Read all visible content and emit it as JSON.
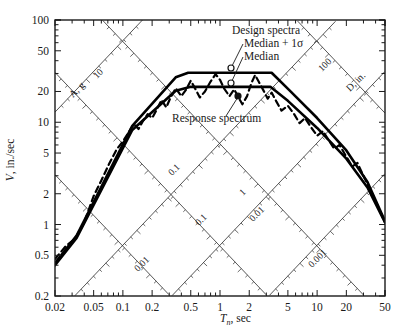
{
  "chart_data": {
    "type": "line",
    "title": "",
    "xlabel": "Tn, sec",
    "ylabel": "V, in./sec",
    "diag_up_label": "D, in.",
    "diag_down_label": "A, g",
    "xlim": [
      0.02,
      50
    ],
    "ylim": [
      0.2,
      100
    ],
    "xscale": "log",
    "yscale": "log",
    "grid": false,
    "xticks": [
      "0.02",
      "0.05",
      "0.1",
      "0.2",
      "0.5",
      "1",
      "2",
      "5",
      "10",
      "20",
      "50"
    ],
    "xtickvals": [
      0.02,
      0.05,
      0.1,
      0.2,
      0.5,
      1,
      2,
      5,
      10,
      20,
      50
    ],
    "yticks": [
      "0.2",
      "0.5",
      "1",
      "2",
      "5",
      "10",
      "20",
      "50",
      "100"
    ],
    "ytickvals": [
      0.2,
      0.5,
      1,
      2,
      5,
      10,
      20,
      50,
      100
    ],
    "diag_accel_labels": [
      "10",
      "0.1",
      "0.01",
      "0.001"
    ],
    "diag_accel_values": [
      10,
      0.1,
      0.01,
      0.001
    ],
    "diag_disp_labels": [
      "0.01",
      "0.1",
      "1",
      "100"
    ],
    "diag_disp_values": [
      0.01,
      0.1,
      1,
      100
    ],
    "series": [
      {
        "name": "Median + 1σ",
        "style": "solid",
        "color": "#000000",
        "width": 2.6,
        "points": [
          [
            0.02,
            0.42
          ],
          [
            0.0334,
            0.78
          ],
          [
            0.125,
            9.2
          ],
          [
            0.35,
            27.5
          ],
          [
            0.47,
            30.5
          ],
          [
            3.4,
            30.5
          ],
          [
            5.2,
            20.5
          ],
          [
            10,
            11.0
          ],
          [
            20,
            5.3
          ],
          [
            33,
            2.6
          ],
          [
            50,
            1.08
          ]
        ]
      },
      {
        "name": "Median",
        "style": "solid",
        "color": "#000000",
        "width": 2.6,
        "points": [
          [
            0.02,
            0.4
          ],
          [
            0.0334,
            0.74
          ],
          [
            0.125,
            8.4
          ],
          [
            0.35,
            20.3
          ],
          [
            0.5,
            22.2
          ],
          [
            3.3,
            22.2
          ],
          [
            5.0,
            16.2
          ],
          [
            10,
            8.8
          ],
          [
            20,
            4.4
          ],
          [
            33,
            2.3
          ],
          [
            50,
            1.05
          ]
        ]
      },
      {
        "name": "Response spectrum",
        "style": "dashed",
        "color": "#000000",
        "width": 2.2,
        "points": [
          [
            0.02,
            0.46
          ],
          [
            0.026,
            0.62
          ],
          [
            0.032,
            0.72
          ],
          [
            0.04,
            1.05
          ],
          [
            0.05,
            1.9
          ],
          [
            0.06,
            2.7
          ],
          [
            0.072,
            3.9
          ],
          [
            0.086,
            5.4
          ],
          [
            0.1,
            6.5
          ],
          [
            0.115,
            8.0
          ],
          [
            0.13,
            9.6
          ],
          [
            0.145,
            8.6
          ],
          [
            0.16,
            10.2
          ],
          [
            0.18,
            12.0
          ],
          [
            0.2,
            11.0
          ],
          [
            0.225,
            13.5
          ],
          [
            0.25,
            16.5
          ],
          [
            0.28,
            14.0
          ],
          [
            0.31,
            17.5
          ],
          [
            0.35,
            21.5
          ],
          [
            0.4,
            18.0
          ],
          [
            0.45,
            21.0
          ],
          [
            0.5,
            25.5
          ],
          [
            0.56,
            21.0
          ],
          [
            0.62,
            17.5
          ],
          [
            0.7,
            20.0
          ],
          [
            0.8,
            25.0
          ],
          [
            0.9,
            29.5
          ],
          [
            1.0,
            26.0
          ],
          [
            1.1,
            21.5
          ],
          [
            1.25,
            18.0
          ],
          [
            1.4,
            21.0
          ],
          [
            1.55,
            17.5
          ],
          [
            1.7,
            15.0
          ],
          [
            1.9,
            18.0
          ],
          [
            2.1,
            24.0
          ],
          [
            2.3,
            29.0
          ],
          [
            2.5,
            25.0
          ],
          [
            2.8,
            20.5
          ],
          [
            3.1,
            17.0
          ],
          [
            3.4,
            19.5
          ],
          [
            3.8,
            16.0
          ],
          [
            4.3,
            13.0
          ],
          [
            5.0,
            14.5
          ],
          [
            5.8,
            12.0
          ],
          [
            6.6,
            9.8
          ],
          [
            7.5,
            11.0
          ],
          [
            8.6,
            9.0
          ],
          [
            10,
            7.4
          ],
          [
            11.5,
            8.2
          ],
          [
            13,
            6.8
          ],
          [
            15,
            5.5
          ],
          [
            17,
            6.0
          ],
          [
            20,
            4.6
          ],
          [
            23,
            3.7
          ],
          [
            26,
            4.0
          ],
          [
            30,
            3.0
          ],
          [
            35,
            2.2
          ],
          [
            41,
            1.6
          ],
          [
            50,
            1.05
          ]
        ]
      }
    ],
    "annotations": [
      {
        "name": "design-spectra-label",
        "text": "Design spectra",
        "x": 232,
        "y": 34
      },
      {
        "name": "median-plus-sigma-label",
        "text": "Median + 1σ",
        "x": 244,
        "y": 47
      },
      {
        "name": "median-label",
        "text": "Median",
        "x": 244,
        "y": 60
      },
      {
        "name": "response-spectrum-label",
        "text": "Response spectrum",
        "x": 172,
        "y": 122
      }
    ]
  }
}
